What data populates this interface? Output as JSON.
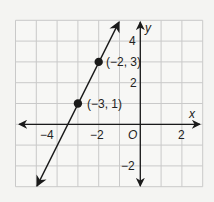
{
  "chart_data": {
    "type": "line",
    "title": "",
    "xlabel": "x",
    "ylabel": "y",
    "xlim": [
      -6,
      3
    ],
    "ylim": [
      -3,
      5
    ],
    "grid": true,
    "x_ticks": [
      -4,
      -2,
      0,
      2
    ],
    "y_ticks": [
      -2,
      2,
      4
    ],
    "x_tick_labels": [
      "−4",
      "−2",
      "O",
      "2"
    ],
    "y_tick_labels": [
      "−2",
      "2",
      "4"
    ],
    "origin_label": "O",
    "series": [
      {
        "name": "line",
        "equation": "y = 2x + 7",
        "x": [
          -5,
          -1
        ],
        "y": [
          -3,
          5
        ],
        "arrows": "both"
      }
    ],
    "points": [
      {
        "x": -2,
        "y": 3,
        "label": "(−2, 3)"
      },
      {
        "x": -3,
        "y": 1,
        "label": "(−3, 1)"
      }
    ],
    "colors": {
      "line": "#1a1a1a",
      "grid": "#c9c9c9",
      "background": "#f4f4f2"
    }
  },
  "labels": {
    "x_axis": "x",
    "y_axis": "y",
    "origin": "O",
    "xtick_m4": "−4",
    "xtick_m2": "−2",
    "xtick_2": "2",
    "ytick_4": "4",
    "ytick_2": "2",
    "ytick_m2": "−2",
    "point_a": "(−2, 3)",
    "point_b": "(−3, 1)"
  }
}
